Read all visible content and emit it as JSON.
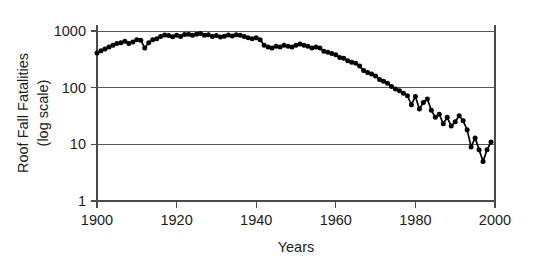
{
  "chart_data": {
    "type": "line",
    "title": "",
    "xlabel": "Years",
    "ylabel": "Roof Fall Fatalities (log scale)",
    "ylabel_line1": "Roof Fall Fatalities",
    "ylabel_line2": "(log  scale)",
    "yscale": "log",
    "ylim": [
      1,
      1000
    ],
    "xlim": [
      1900,
      2000
    ],
    "ytick_labels": [
      "1000",
      "100",
      "10",
      "1"
    ],
    "ytick_values": [
      1000,
      100,
      10,
      1
    ],
    "xtick_labels": [
      "1900",
      "1920",
      "1940",
      "1960",
      "1980",
      "2000"
    ],
    "xtick_values": [
      1900,
      1920,
      1940,
      1960,
      1980,
      2000
    ],
    "grid": true,
    "grid_axis": "y",
    "legend": false,
    "marker": "filled-circle",
    "line_color": "#000000",
    "series": [
      {
        "name": "Roof Fall Fatalities",
        "x": [
          1900,
          1901,
          1902,
          1903,
          1904,
          1905,
          1906,
          1907,
          1908,
          1909,
          1910,
          1911,
          1912,
          1913,
          1914,
          1915,
          1916,
          1917,
          1918,
          1919,
          1920,
          1921,
          1922,
          1923,
          1924,
          1925,
          1926,
          1927,
          1928,
          1929,
          1930,
          1931,
          1932,
          1933,
          1934,
          1935,
          1936,
          1937,
          1938,
          1939,
          1940,
          1941,
          1942,
          1943,
          1944,
          1945,
          1946,
          1947,
          1948,
          1949,
          1950,
          1951,
          1952,
          1953,
          1954,
          1955,
          1956,
          1957,
          1958,
          1959,
          1960,
          1961,
          1962,
          1963,
          1964,
          1965,
          1966,
          1967,
          1968,
          1969,
          1970,
          1971,
          1972,
          1973,
          1974,
          1975,
          1976,
          1977,
          1978,
          1979,
          1980,
          1981,
          1982,
          1983,
          1984,
          1985,
          1986,
          1987,
          1988,
          1989,
          1990,
          1991,
          1992,
          1993,
          1994,
          1995,
          1996,
          1997,
          1998,
          1999
        ],
        "y": [
          410,
          450,
          480,
          520,
          560,
          600,
          620,
          660,
          600,
          640,
          700,
          690,
          500,
          620,
          700,
          730,
          800,
          850,
          830,
          790,
          840,
          800,
          870,
          880,
          840,
          880,
          900,
          840,
          860,
          800,
          830,
          780,
          810,
          850,
          820,
          860,
          840,
          800,
          760,
          730,
          760,
          700,
          560,
          520,
          500,
          540,
          520,
          560,
          540,
          520,
          560,
          590,
          560,
          540,
          500,
          520,
          500,
          440,
          420,
          400,
          380,
          340,
          330,
          300,
          280,
          270,
          240,
          200,
          185,
          175,
          160,
          140,
          130,
          120,
          105,
          95,
          88,
          80,
          72,
          50,
          70,
          42,
          55,
          63,
          40,
          30,
          34,
          23,
          30,
          21,
          25,
          32,
          26,
          18,
          9,
          13,
          8,
          5,
          8,
          11
        ]
      }
    ]
  },
  "axis": {
    "x_title": "Years",
    "y_title_line1": "Roof Fall Fatalities",
    "y_title_line2": "(log  scale)"
  }
}
